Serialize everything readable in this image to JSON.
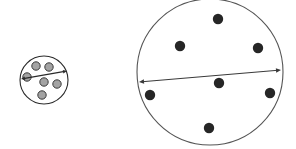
{
  "figure": {
    "background_color": "#ffffff",
    "width": 296,
    "height": 149
  },
  "objects": [
    {
      "name": "small-circle",
      "label": "small circle",
      "cx": 44,
      "cy": 80,
      "r": 24,
      "stroke": "#2b2b2b",
      "stroke_width": 1.1,
      "fill": "#ffffff",
      "dot_fill": "#a3a3a3",
      "dot_stroke": "#3a3a3a",
      "dot_r": 4.2,
      "dot_count": 6,
      "dots": [
        {
          "cx": 36,
          "cy": 66
        },
        {
          "cx": 49,
          "cy": 67
        },
        {
          "cx": 27,
          "cy": 77
        },
        {
          "cx": 44,
          "cy": 82
        },
        {
          "cx": 57,
          "cy": 84
        },
        {
          "cx": 42,
          "cy": 95
        }
      ],
      "arrow": {
        "name": "diameter-arrow-small",
        "x1": 21,
        "y1": 79,
        "x2": 67,
        "y2": 71,
        "stroke": "#2b2b2b",
        "stroke_width": 1.2,
        "head_size": 4.0,
        "double_headed": true
      }
    },
    {
      "name": "large-circle",
      "label": "large circle",
      "cx": 210,
      "cy": 72,
      "r": 73,
      "stroke": "#555555",
      "stroke_width": 1.1,
      "fill": "#ffffff",
      "dot_fill": "#262626",
      "dot_stroke": "#262626",
      "dot_r": 5.2,
      "dot_count": 7,
      "dots": [
        {
          "cx": 218,
          "cy": 19
        },
        {
          "cx": 180,
          "cy": 46
        },
        {
          "cx": 258,
          "cy": 48
        },
        {
          "cx": 219,
          "cy": 83
        },
        {
          "cx": 150,
          "cy": 95
        },
        {
          "cx": 270,
          "cy": 93
        },
        {
          "cx": 209,
          "cy": 128
        }
      ],
      "arrow": {
        "name": "diameter-arrow-large",
        "x1": 139,
        "y1": 82,
        "x2": 281,
        "y2": 70,
        "stroke": "#3a3a3a",
        "stroke_width": 1.2,
        "head_size": 5.0,
        "double_headed": true
      }
    }
  ],
  "annotations": {
    "visible_text": []
  }
}
